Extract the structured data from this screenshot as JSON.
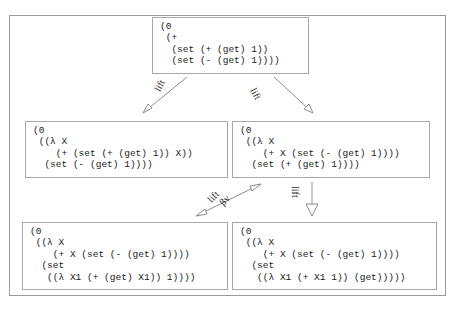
{
  "figure": {
    "kind": "reduction-graph",
    "colors": {
      "frame_border": "#9a9a9a",
      "node_border": "#a8a8a8",
      "arrow": "#8d8d8d",
      "text": "#1b1b1b",
      "background": "#ffffff"
    }
  },
  "nodes": {
    "root": {
      "id": "root",
      "code": "(0\n (+\n  (set (+ (get) 1))\n  (set (- (get) 1))))"
    },
    "left_mid": {
      "id": "left-mid",
      "code": "(0\n ((λ X\n    (+ (set (+ (get) 1)) X))\n  (set (- (get) 1))))"
    },
    "right_mid": {
      "id": "right-mid",
      "code": "(0\n ((λ X\n    (+ X (set (- (get) 1))))\n  (set (+ (get) 1))))"
    },
    "left_bot": {
      "id": "left-bot",
      "code": "(0\n ((λ X\n    (+ X (set (- (get) 1))))\n  (set\n   ((λ X1 (+ (get) X1)) 1))))"
    },
    "right_bot": {
      "id": "right-bot",
      "code": "(0\n ((λ X\n    (+ X (set (- (get) 1))))\n  (set\n   ((λ X1 (+ X1 1)) (get)))))"
    }
  },
  "edges": {
    "root_to_left_mid": {
      "label": "lift",
      "from": "root",
      "to": "left-mid"
    },
    "root_to_right_mid": {
      "label": "lift",
      "from": "root",
      "to": "right-mid"
    },
    "right_mid_to_left_bot_up": {
      "label": "lift",
      "from": "left-bot",
      "to": "right-mid"
    },
    "right_mid_to_left_bot_down": {
      "label": "βv",
      "from": "right-mid",
      "to": "left-bot"
    },
    "right_mid_to_right_bot": {
      "label": "lift",
      "from": "right-mid",
      "to": "right-bot"
    }
  }
}
